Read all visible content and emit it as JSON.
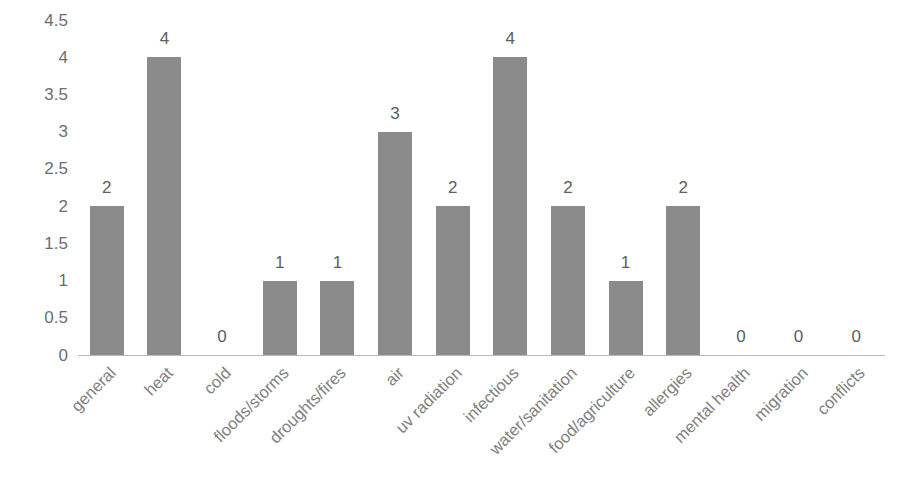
{
  "chart_data": {
    "type": "bar",
    "title": "",
    "subtitle": "",
    "xlabel": "",
    "ylabel": "",
    "ylim": [
      0,
      4.5
    ],
    "grid": false,
    "legend": false,
    "legend_position": "none",
    "bar_color": "#8b8b8b",
    "axis_line_color": "#b9b9b9",
    "tick_label_color": "#6e6e6e",
    "category_label_color": "#808080",
    "data_label_color": "#5e5e5e",
    "background_color": "#ffffff",
    "category_label_rotation": -45,
    "y_ticks": [
      "0",
      "0.5",
      "1",
      "1.5",
      "2",
      "2.5",
      "3",
      "3.5",
      "4",
      "4.5"
    ],
    "y_tick_values": [
      0,
      0.5,
      1,
      1.5,
      2,
      2.5,
      3,
      3.5,
      4,
      4.5
    ],
    "categories": [
      "general",
      "heat",
      "cold",
      "floods/storms",
      "droughts/fires",
      "air",
      "uv radiation",
      "infectious",
      "water/sanitation",
      "food/agriculture",
      "allergies",
      "mental health",
      "migration",
      "conflicts"
    ],
    "values": [
      2,
      4,
      0,
      1,
      1,
      3,
      2,
      4,
      2,
      1,
      2,
      0,
      0,
      0
    ],
    "data_labels": [
      "2",
      "4",
      "0",
      "1",
      "1",
      "3",
      "2",
      "4",
      "2",
      "1",
      "2",
      "0",
      "0",
      "0"
    ]
  }
}
